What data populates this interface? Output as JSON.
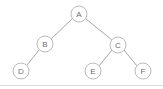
{
  "diagram": {
    "background_color": "#ffffff",
    "node_fill": "#ffffff",
    "node_stroke": "#b2b2b2",
    "edge_color": "#9b9b9b",
    "label_color": "#6d6d6d",
    "node_radius": 8,
    "nodes": [
      {
        "id": "A",
        "label": "A",
        "cx": 79,
        "cy": 14
      },
      {
        "id": "B",
        "label": "B",
        "cx": 45,
        "cy": 44
      },
      {
        "id": "C",
        "label": "C",
        "cx": 118,
        "cy": 45
      },
      {
        "id": "D",
        "label": "D",
        "cx": 21,
        "cy": 71
      },
      {
        "id": "E",
        "label": "E",
        "cx": 93,
        "cy": 71
      },
      {
        "id": "F",
        "label": "F",
        "cx": 143,
        "cy": 71
      }
    ],
    "edges": [
      {
        "from": "A",
        "to": "B",
        "x1": 72,
        "y1": 19,
        "x2": 51,
        "y2": 39
      },
      {
        "from": "A",
        "to": "C",
        "x1": 86,
        "y1": 19,
        "x2": 112,
        "y2": 40
      },
      {
        "from": "B",
        "to": "D",
        "x1": 39,
        "y1": 50,
        "x2": 27,
        "y2": 65
      },
      {
        "from": "C",
        "to": "E",
        "x1": 112,
        "y1": 50,
        "x2": 99,
        "y2": 66
      },
      {
        "from": "C",
        "to": "F",
        "x1": 124,
        "y1": 50,
        "x2": 137,
        "y2": 66
      }
    ],
    "bottom_rule": {
      "x1": 0,
      "y1": 85.5,
      "x2": 163,
      "y2": 85.5,
      "color": "#dcdcdc"
    }
  }
}
